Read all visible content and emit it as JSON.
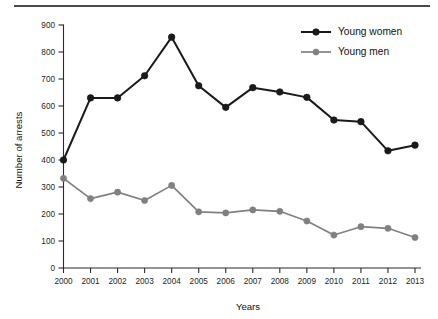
{
  "chart_data": {
    "type": "line",
    "title": "",
    "xlabel": "Years",
    "ylabel": "Number of arrests",
    "categories": [
      "2000",
      "2001",
      "2002",
      "2003",
      "2004",
      "2005",
      "2006",
      "2007",
      "2008",
      "2009",
      "2010",
      "2011",
      "2012",
      "2013"
    ],
    "x": [
      2000,
      2001,
      2002,
      2003,
      2004,
      2005,
      2006,
      2007,
      2008,
      2009,
      2010,
      2011,
      2012,
      2013
    ],
    "series": [
      {
        "name": "Young women",
        "color": "#1a1a1a",
        "marker": "circle",
        "values": [
          400,
          630,
          630,
          712,
          855,
          675,
          595,
          668,
          652,
          632,
          548,
          542,
          434,
          455
        ]
      },
      {
        "name": "Young men",
        "color": "#808080",
        "marker": "circle",
        "values": [
          332,
          257,
          281,
          250,
          306,
          208,
          204,
          215,
          210,
          174,
          122,
          153,
          147,
          113
        ]
      }
    ],
    "ylim": [
      0,
      900
    ],
    "yticks": [
      0,
      100,
      200,
      300,
      400,
      500,
      600,
      700,
      800,
      900
    ],
    "ytick_labels": [
      "0",
      "100",
      "200",
      "300",
      "400",
      "500",
      "600",
      "700",
      "800",
      "900"
    ],
    "xlim": [
      2000,
      2013
    ],
    "grid": false,
    "legend_position": "top-right",
    "legend": [
      "Young women",
      "Young men"
    ]
  },
  "legend": {
    "entries": [
      {
        "label": "Young women",
        "color": "#1a1a1a"
      },
      {
        "label": "Young men",
        "color": "#808080"
      }
    ]
  },
  "axes": {
    "x_title": "Years",
    "y_title": "Number of arrests"
  }
}
